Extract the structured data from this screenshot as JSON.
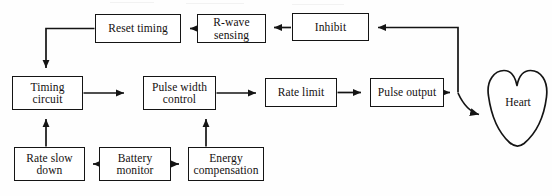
{
  "diagram": {
    "background_color": "#fefefe",
    "line_color": "#141414",
    "text_color": "#14100f",
    "nodes": [
      {
        "id": "reset_timing",
        "label": "Reset timing",
        "x": 95,
        "y": 14,
        "w": 86,
        "h": 29
      },
      {
        "id": "r_wave_sensing",
        "label": "R-wave\nsensing",
        "x": 197,
        "y": 14,
        "w": 69,
        "h": 29
      },
      {
        "id": "inhibit",
        "label": "Inhibit",
        "x": 292,
        "y": 13,
        "w": 77,
        "h": 28
      },
      {
        "id": "timing_circuit",
        "label": "Timing\ncircuit",
        "x": 12,
        "y": 76,
        "w": 71,
        "h": 34
      },
      {
        "id": "pulse_width_control",
        "label": "Pulse width\ncontrol",
        "x": 143,
        "y": 76,
        "w": 73,
        "h": 34
      },
      {
        "id": "rate_limit",
        "label": "Rate limit",
        "x": 265,
        "y": 78,
        "w": 72,
        "h": 29
      },
      {
        "id": "pulse_output",
        "label": "Pulse output",
        "x": 370,
        "y": 78,
        "w": 74,
        "h": 29
      },
      {
        "id": "rate_slow_down",
        "label": "Rate slow\ndown",
        "x": 14,
        "y": 147,
        "w": 71,
        "h": 34
      },
      {
        "id": "battery_monitor",
        "label": "Battery\nmonitor",
        "x": 99,
        "y": 147,
        "w": 72,
        "h": 34
      },
      {
        "id": "energy_compensation",
        "label": "Energy\ncompensation",
        "x": 188,
        "y": 147,
        "w": 76,
        "h": 34
      }
    ],
    "organ": {
      "id": "heart",
      "label": "Heart"
    },
    "connections": [
      {
        "from": "r_wave_sensing",
        "to": "reset_timing",
        "kind": "arrow-left"
      },
      {
        "from": "inhibit",
        "to": "r_wave_sensing",
        "kind": "arrow-left"
      },
      {
        "from": "reset_timing",
        "to": "timing_circuit",
        "kind": "arrow-down"
      },
      {
        "from": "timing_circuit",
        "to": "pulse_width_control",
        "kind": "arrow-right"
      },
      {
        "from": "pulse_width_control",
        "to": "rate_limit",
        "kind": "arrow-right"
      },
      {
        "from": "rate_limit",
        "to": "pulse_output",
        "kind": "arrow-right"
      },
      {
        "from": "pulse_output",
        "to": "heart",
        "kind": "arrow-curve"
      },
      {
        "from": "pulse_output",
        "to": "inhibit",
        "kind": "feedback-arrow-left"
      },
      {
        "from": "rate_slow_down",
        "to": "timing_circuit",
        "kind": "arrow-up"
      },
      {
        "from": "battery_monitor",
        "to": "rate_slow_down",
        "kind": "arrow-left"
      },
      {
        "from": "battery_monitor",
        "to": "energy_compensation",
        "kind": "arrow-right"
      },
      {
        "from": "energy_compensation",
        "to": "pulse_width_control",
        "kind": "arrow-up"
      }
    ]
  }
}
